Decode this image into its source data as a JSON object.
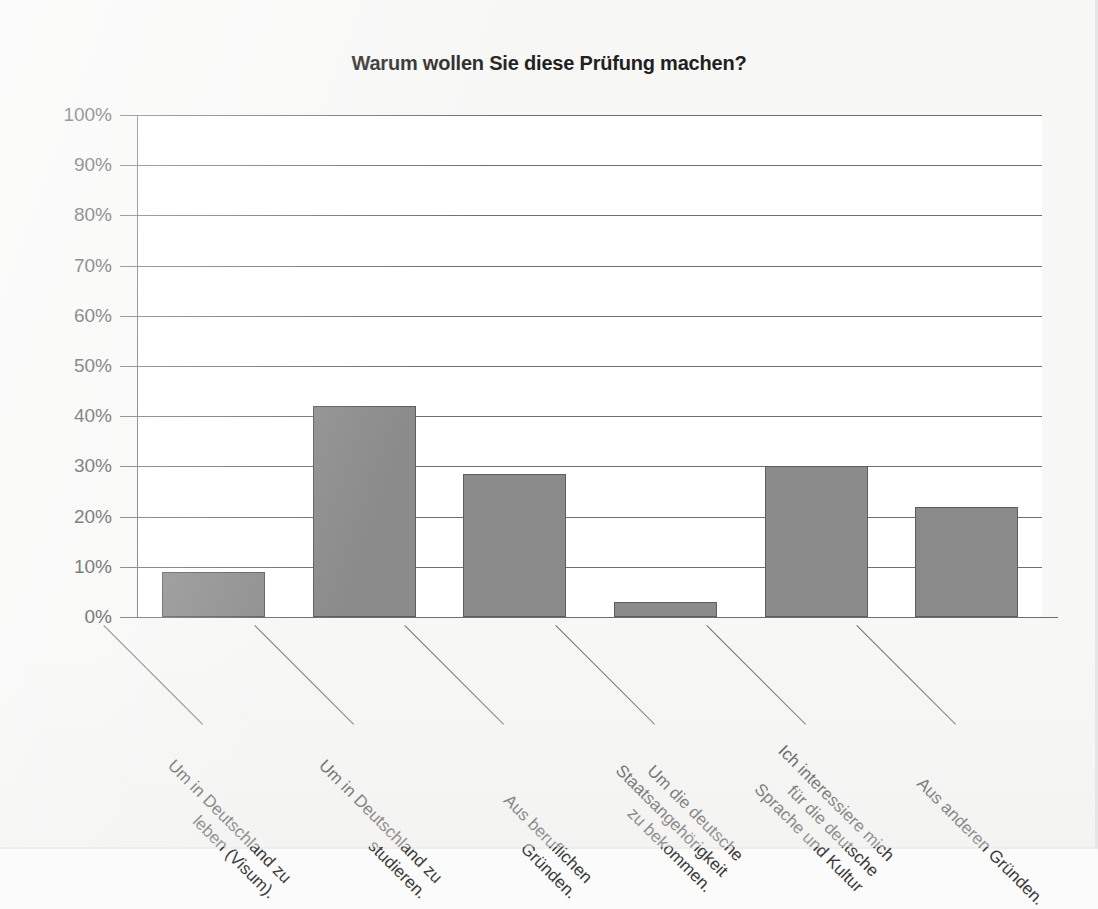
{
  "chart_data": {
    "type": "bar",
    "title": "Warum wollen Sie diese Prüfung machen?",
    "xlabel": "",
    "ylabel": "",
    "ylim": [
      0,
      100
    ],
    "yticks": [
      "0%",
      "10%",
      "20%",
      "30%",
      "40%",
      "50%",
      "60%",
      "70%",
      "80%",
      "90%",
      "100%"
    ],
    "ytick_values": [
      0,
      10,
      20,
      30,
      40,
      50,
      60,
      70,
      80,
      90,
      100
    ],
    "grid": true,
    "legend": "none",
    "categories": [
      "Um in Deutschland zu\nleben (Visum).",
      "Um in Deutschland zu\nstudieren.",
      "Aus beruflichen\nGründen.",
      "Um die deutsche\nStaatsangehörigkeit\nzu bekommen.",
      "Ich interessiere mich\nfür die deutsche\nSprache und Kultur",
      "Aus anderen Gründen."
    ],
    "values": [
      9,
      42,
      28.5,
      3,
      30,
      22
    ],
    "bar_color": "#8b8b8b",
    "bar_border_color": "#5d5d5d",
    "axis_color": "#6f6f6f",
    "plot_background": "#ffffff",
    "page_background": "#f7f7f6"
  }
}
